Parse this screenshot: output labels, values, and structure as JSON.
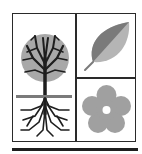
{
  "emblem": {
    "panels": [
      {
        "id": "tree",
        "icon": "tree-with-roots-icon"
      },
      {
        "id": "leaf",
        "icon": "leaf-icon"
      },
      {
        "id": "flower",
        "icon": "flower-icon"
      }
    ],
    "colors": {
      "frame": "#2a2a2a",
      "canopy": "#a8a8a8",
      "branches": "#1e1e1e",
      "leaf_dark": "#7a7a7a",
      "leaf_light": "#b5b5b5",
      "flower": "#a0a0a0",
      "background": "#ffffff"
    }
  }
}
